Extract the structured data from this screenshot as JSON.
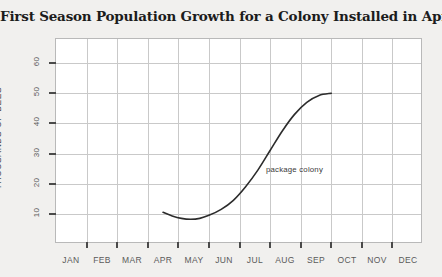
{
  "chart_data": {
    "type": "line",
    "title": "First Season Population Growth for a Colony Installed in April",
    "xlabel": "",
    "ylabel": "THOUSANDS OF BEES",
    "categories": [
      "JAN",
      "FEB",
      "MAR",
      "APR",
      "MAY",
      "JUN",
      "JUL",
      "AUG",
      "SEP",
      "OCT",
      "NOV",
      "DEC"
    ],
    "ytick_labels": [
      "10",
      "20",
      "30",
      "40",
      "50",
      "60"
    ],
    "ytick_values": [
      10,
      20,
      30,
      40,
      50,
      60
    ],
    "ylim": [
      0,
      68
    ],
    "xlim": [
      0,
      12
    ],
    "grid": true,
    "legend_position": "none",
    "series": [
      {
        "name": "package colony",
        "annotation": "package colony",
        "x": [
          3.5,
          3.8,
          4.1,
          4.4,
          4.7,
          5.0,
          5.4,
          5.8,
          6.2,
          6.6,
          7.0,
          7.4,
          7.8,
          8.2,
          8.6,
          9.0
        ],
        "values": [
          10.5,
          9.3,
          8.5,
          8.2,
          8.5,
          9.5,
          11.5,
          14.5,
          19.0,
          24.5,
          31.0,
          37.5,
          43.0,
          47.0,
          49.3,
          50.0
        ]
      }
    ],
    "colors": {
      "curve": "#2c2c2c",
      "grid": "#c9c9c9",
      "frame": "#b9b9b9",
      "plot_background": "#ffffff",
      "page_background": "#f1f0ee",
      "title_text": "#1c1c1c",
      "tick_text": "#5a5a5a"
    }
  }
}
